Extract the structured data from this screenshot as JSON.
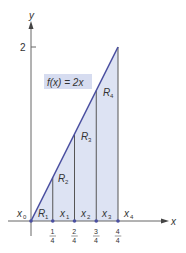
{
  "diagram": {
    "type": "riemann-sum-rectangles",
    "function_label": "f(x) = 2x",
    "axis_labels": {
      "x": "x",
      "y": "y"
    },
    "y_ticks": [
      {
        "value": 2,
        "label": "2"
      }
    ],
    "x_ticks": [
      {
        "num": "1",
        "den": "4"
      },
      {
        "num": "2",
        "den": "4"
      },
      {
        "num": "3",
        "den": "4"
      },
      {
        "num": "4",
        "den": "4"
      }
    ],
    "partition_points": [
      {
        "name": "x",
        "sub": "0"
      },
      {
        "name": "x",
        "sub": "1"
      },
      {
        "name": "x",
        "sub": "2"
      },
      {
        "name": "x",
        "sub": "3"
      },
      {
        "name": "x",
        "sub": "4"
      }
    ],
    "regions": [
      {
        "name": "R",
        "sub": "1"
      },
      {
        "name": "R",
        "sub": "2"
      },
      {
        "name": "R",
        "sub": "3"
      },
      {
        "name": "R",
        "sub": "4"
      }
    ],
    "colors": {
      "line": "#4a4fa0",
      "fill": "#dde3f3",
      "label_bg": "#d6dcf0",
      "axis": "#555555",
      "dot": "#4a4fa0"
    }
  }
}
